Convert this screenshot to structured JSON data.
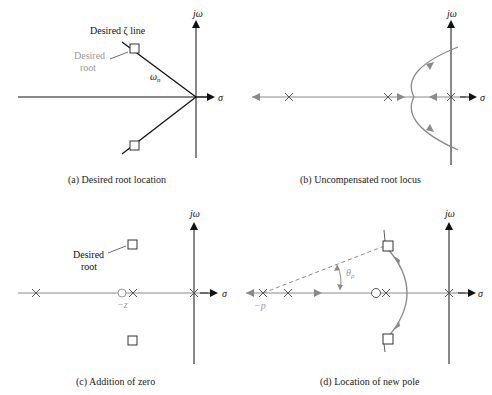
{
  "colors": {
    "axis": "#111111",
    "locus": "#8a8a8a",
    "highlight_text": "#9a9a9a",
    "marker_fill": "#ffffff"
  },
  "axes_labels": {
    "imag": "jω",
    "real": "σ"
  },
  "panels": [
    {
      "id": "a",
      "caption": "(a)  Desired root location",
      "labels": {
        "zeta_line": "Desired ζ line",
        "desired_root_1": "Desired",
        "desired_root_2": "root",
        "omega_n": "ω",
        "omega_n_sub": "n"
      }
    },
    {
      "id": "b",
      "caption": "(b)  Uncompensated root locus"
    },
    {
      "id": "c",
      "caption": "(c)  Addition of zero",
      "labels": {
        "desired_root_1": "Desired",
        "desired_root_2": "root",
        "zero": "−z"
      }
    },
    {
      "id": "d",
      "caption": "(d)  Location of new pole",
      "labels": {
        "pole": "−p",
        "theta": "θ",
        "theta_sub": "p"
      }
    }
  ]
}
